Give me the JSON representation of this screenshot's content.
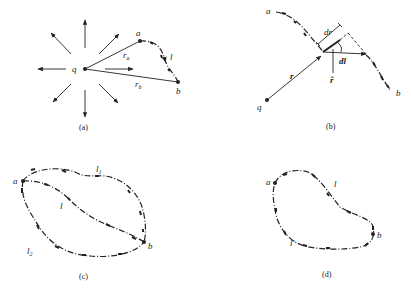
{
  "panels": {
    "a": {
      "caption": "(a)",
      "charge": "q",
      "point_a": "a",
      "point_b": "b",
      "radius_a": "r",
      "radius_a_sub": "a",
      "radius_b": "r",
      "radius_b_sub": "b",
      "path_label": "l",
      "radial_arrow_count": 8
    },
    "b": {
      "caption": "(b)",
      "charge": "q",
      "point_a": "a",
      "point_b": "b",
      "position_vector": "r",
      "dr_label": "dr",
      "dl_label": "dl",
      "unit_vector": "r̂"
    },
    "c": {
      "caption": "(c)",
      "point_a": "a",
      "point_b": "b",
      "path_l1": "l",
      "path_l1_sub": "1",
      "path_l": "l",
      "path_l2": "l",
      "path_l2_sub": "2"
    },
    "d": {
      "caption": "(d)",
      "point_a": "a",
      "point_b": "b",
      "path_l": "l",
      "path_lprime": "l′"
    }
  }
}
